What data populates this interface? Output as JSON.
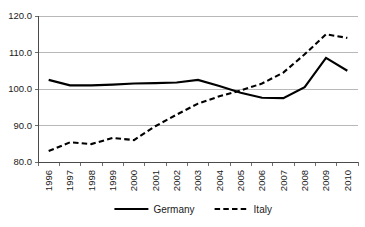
{
  "chart_data": {
    "type": "line",
    "title": "",
    "subtitle": "",
    "xlabel": "",
    "ylabel": "",
    "x": [
      1996,
      1997,
      1998,
      1999,
      2000,
      2001,
      2002,
      2003,
      2004,
      2005,
      2006,
      2007,
      2008,
      2009,
      2010
    ],
    "categories": [
      "1996",
      "1997",
      "1998",
      "1999",
      "2000",
      "2001",
      "2002",
      "2003",
      "2004",
      "2005",
      "2006",
      "2007",
      "2008",
      "2009",
      "2010"
    ],
    "series": [
      {
        "name": "Germany",
        "style": "solid",
        "color": "#000000",
        "values": [
          102.5,
          101.0,
          101.0,
          101.2,
          101.5,
          101.6,
          101.8,
          102.5,
          100.8,
          99.0,
          97.6,
          97.5,
          100.5,
          108.5,
          105.0
        ]
      },
      {
        "name": "Italy",
        "style": "dashed",
        "color": "#000000",
        "values": [
          83.0,
          85.4,
          84.9,
          86.6,
          86.0,
          89.8,
          93.0,
          96.0,
          98.0,
          99.6,
          101.5,
          104.5,
          109.5,
          115.0,
          114.0
        ]
      }
    ],
    "ylim": [
      80.0,
      120.0
    ],
    "ytick_values": [
      80.0,
      90.0,
      100.0,
      110.0,
      120.0
    ],
    "ytick_labels": [
      "80.0",
      "90.0",
      "100.0",
      "110.0",
      "120.0"
    ],
    "grid": true,
    "grid_axis": "y",
    "legend_position": "bottom",
    "legend_entries": [
      "Germany",
      "Italy"
    ],
    "xtick_label_rotation": 90
  }
}
